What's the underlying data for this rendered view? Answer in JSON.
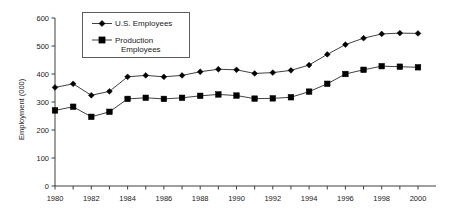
{
  "chart_data": {
    "type": "line",
    "title": "",
    "xlabel": "",
    "ylabel": "Employment (000)",
    "xlim": [
      1980,
      2000
    ],
    "ylim": [
      0,
      600
    ],
    "grid": false,
    "legend_position": "top-left-inside",
    "x": [
      1980,
      1981,
      1982,
      1983,
      1984,
      1985,
      1986,
      1987,
      1988,
      1989,
      1990,
      1991,
      1992,
      1993,
      1994,
      1995,
      1996,
      1997,
      1998,
      1999,
      2000
    ],
    "xtick_labels": [
      "1980",
      "1982",
      "1984",
      "1986",
      "1988",
      "1990",
      "1992",
      "1994",
      "1996",
      "1998",
      "2000"
    ],
    "xtick_values": [
      1980,
      1982,
      1984,
      1986,
      1988,
      1990,
      1992,
      1994,
      1996,
      1998,
      2000
    ],
    "ytick_labels": [
      "0",
      "100",
      "200",
      "300",
      "400",
      "500",
      "600"
    ],
    "ytick_values": [
      0,
      100,
      200,
      300,
      400,
      500,
      600
    ],
    "series": [
      {
        "name": "U.S. Employees",
        "marker": "diamond",
        "color": "#000000",
        "values": [
          352,
          365,
          324,
          338,
          390,
          395,
          390,
          395,
          408,
          417,
          415,
          402,
          405,
          413,
          432,
          470,
          505,
          528,
          543,
          546,
          545
        ]
      },
      {
        "name": "Production Employees",
        "marker": "square",
        "color": "#000000",
        "values": [
          270,
          283,
          247,
          265,
          311,
          315,
          311,
          315,
          322,
          327,
          323,
          312,
          313,
          317,
          337,
          365,
          400,
          415,
          428,
          426,
          424
        ]
      }
    ]
  },
  "legend": {
    "entries": [
      {
        "label": "U.S. Employees",
        "label_line2": "",
        "marker": "diamond"
      },
      {
        "label": "Production",
        "label_line2": "Employees",
        "marker": "square"
      }
    ]
  },
  "axes": {
    "y_axis_title": "Employment (000)"
  }
}
